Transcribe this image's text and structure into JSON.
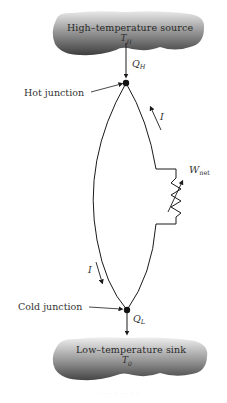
{
  "diagram": {
    "source": {
      "label": "High–temperature source",
      "temp_symbol": "T",
      "temp_sub": "H"
    },
    "sink": {
      "label": "Low–temperature sink",
      "temp_symbol": "T",
      "temp_sub": "0"
    },
    "heat_in": {
      "symbol": "Q",
      "sub": "H"
    },
    "heat_out": {
      "symbol": "Q",
      "sub": "L"
    },
    "hot_junction_label": "Hot junction",
    "cold_junction_label": "Cold junction",
    "current_label_top": "I",
    "current_label_bottom": "I",
    "work": {
      "symbol": "W",
      "sub": "net"
    },
    "footer_watermark": "· · · · · · · ·"
  },
  "colors": {
    "cloud_dark": "#4a4a4a",
    "cloud_light": "#d0d0d0",
    "line": "#1a1a1a",
    "background": "#ffffff"
  }
}
